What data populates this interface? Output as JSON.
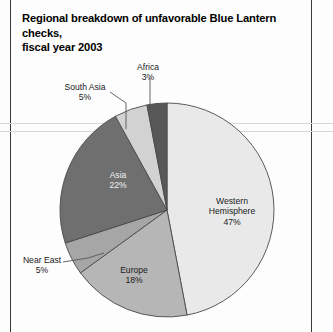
{
  "title": {
    "line1": "Regional breakdown of unfavorable Blue Lantern checks,",
    "line2": "fiscal year 2003"
  },
  "chart_data": {
    "type": "pie",
    "title": "Regional breakdown of unfavorable Blue Lantern checks, fiscal year 2003",
    "xlabel": "",
    "ylabel": "",
    "legend_position": "none",
    "grid": false,
    "units": "percent",
    "total": 100,
    "start_angle_deg": 0,
    "direction": "clockwise",
    "categories": [
      "Western Hemisphere",
      "Europe",
      "Near East",
      "Asia",
      "South Asia",
      "Africa"
    ],
    "values": [
      47,
      18,
      5,
      22,
      5,
      3
    ],
    "slices": [
      {
        "label": "Western Hemisphere",
        "value": 47,
        "value_text": "47%",
        "color": "#e9e9e9",
        "label_placement": "inside"
      },
      {
        "label": "Europe",
        "value": 18,
        "value_text": "18%",
        "color": "#b6b6b6",
        "label_placement": "inside"
      },
      {
        "label": "Near East",
        "value": 5,
        "value_text": "5%",
        "color": "#a6a6a6",
        "label_placement": "outside-leader"
      },
      {
        "label": "Asia",
        "value": 22,
        "value_text": "22%",
        "color": "#6f6f6f",
        "label_placement": "inside"
      },
      {
        "label": "South Asia",
        "value": 5,
        "value_text": "5%",
        "color": "#d2d2d2",
        "label_placement": "outside-leader"
      },
      {
        "label": "Africa",
        "value": 3,
        "value_text": "3%",
        "color": "#585858",
        "label_placement": "outside-leader"
      }
    ]
  },
  "colors": {
    "page_background": "#fdfdfd",
    "title_text": "#000000",
    "label_text": "#1a1a1a",
    "label_text_on_dark": "#f2f2f2",
    "slice_outline": "#4a4a4a",
    "leader_line": "#555555",
    "frame_rule": "#3a3a3a"
  }
}
